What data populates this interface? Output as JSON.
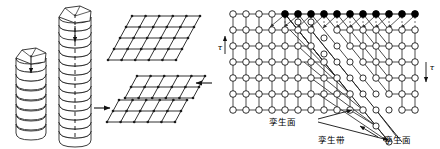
{
  "figure": {
    "background_color": "#ffffff",
    "line_color": "#1a1a1a",
    "width": 440,
    "height": 149
  },
  "left_panel": {
    "name": "coin-stack-shear-illustration",
    "description": "Two stacks of hexagonal-topped discs and two parallelogram lattice planes showing shear",
    "stacks": [
      {
        "id": "short-stack",
        "label": "",
        "disc_count": 8,
        "has_hexagon_top": true,
        "has_arrow": true
      },
      {
        "id": "tall-stack",
        "label": "",
        "disc_count": 14,
        "has_hexagon_top": true,
        "has_arrow": true
      }
    ],
    "grids": [
      {
        "id": "upper-sheared-grid",
        "cols": 5,
        "rows": 4,
        "sheared": true
      },
      {
        "id": "lower-twin-grid-top-half",
        "cols": 5,
        "rows": 2,
        "sheared": true
      },
      {
        "id": "lower-twin-grid-bottom-half",
        "cols": 5,
        "rows": 2,
        "sheared": true
      }
    ],
    "arrows": [
      {
        "id": "arrow-stack-to-grid",
        "direction": "right"
      },
      {
        "id": "arrow-grid-shear",
        "direction": "left"
      }
    ]
  },
  "right_panel": {
    "name": "twin-lattice-diagram",
    "description": "Square atomic lattice with a twinned band; top row atoms filled black with displacement arrows",
    "lattice": {
      "cols": 14,
      "rows": 6,
      "spacing_x": 13,
      "spacing_y": 16,
      "origin_x": 233,
      "origin_y": 14,
      "open_atom_fill": "#ffffff",
      "filled_atom_fill": "#000000",
      "atom_radius": 3.3
    },
    "stress_labels": [
      {
        "id": "tau-left",
        "symbol": "τ",
        "arrow_direction": "up"
      },
      {
        "id": "tau-right",
        "symbol": "τ",
        "arrow_direction": "down"
      }
    ],
    "callouts": [
      {
        "id": "twin-plane-left",
        "text": "孪生面"
      },
      {
        "id": "twin-band",
        "text": "孪生带"
      },
      {
        "id": "twin-plane-right",
        "text": "孪生面"
      }
    ]
  }
}
